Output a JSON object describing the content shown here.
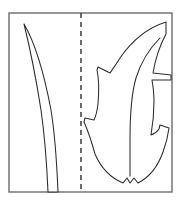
{
  "figure": {
    "background_color": "#ffffff",
    "frame": {
      "label": "panel-border",
      "color": "#6b6b6b",
      "x": 9,
      "y": 13,
      "width": 163,
      "height": 179,
      "stroke_width": 1.4
    },
    "fold_line": {
      "label": "dashed fold axis",
      "color": "#3b3b3b",
      "orientation": "vertical",
      "x": 81,
      "y_start": 13,
      "y_end": 192,
      "dash_pattern": "5 4",
      "stroke_width": 1.5
    },
    "shapes": [
      {
        "name": "blade-leaf",
        "side": "left",
        "description": "narrow tapered blade of grass curving from upper-left tip down to the bottom edge",
        "stroke_color": "#2b2b2b",
        "fill_color": "#ffffff",
        "tip": {
          "x": 24,
          "y": 24
        },
        "base": {
          "x": 48,
          "y": 192
        },
        "path": "M24,24 C34,41 44,73 51,110 C56,141 57,170 58,192 L48,192 C47,168 45,138 41,110 C35,72 29,44 24,24 Z"
      },
      {
        "name": "flame-leaf",
        "side": "right",
        "description": "serrated flame-like leaf with pointed apex, four side notches and a small V notch at the base",
        "stroke_color": "#2b2b2b",
        "fill_color": "#ffffff",
        "apex": {
          "x": 166,
          "y": 22
        },
        "base_notch": {
          "x": 130,
          "y": 183
        },
        "path": "M166,22 C147,28 131,42 120,58 C115,66 112,70 110,73 L98,67 L97,70 C99,79 99,92 98,104 C97,112 96,116 94,120 L85,118 L84,122 C88,131 92,143 95,154 C101,168 111,178 123,183 L127,178 L130,183 L134,178 L138,183 C150,177 158,166 163,152 C166,144 168,136 169,128 L160,125 L159,129 C157,132 154,134 151,135 C153,124 154,112 154,101 C154,93 153,86 152,80 L171,80 L171,75 L153,73 C155,61 159,47 166,34 Z",
        "vein_path": "M160,38 C150,48 141,62 136,78 C131,95 130,118 130,140 C130,155 130,168 130,176"
      }
    ]
  }
}
